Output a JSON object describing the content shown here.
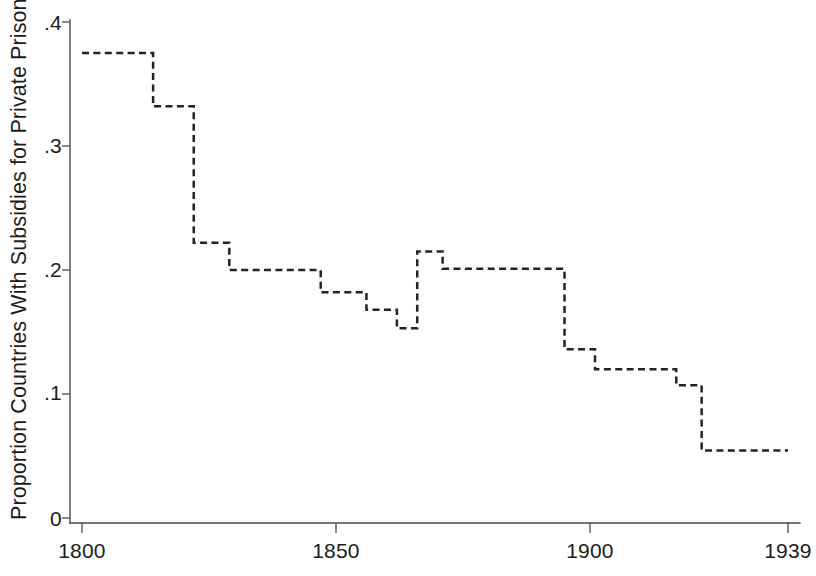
{
  "chart_data": {
    "type": "line",
    "line_style": "dashed step function",
    "title": "",
    "subtitle": "",
    "xlabel": "",
    "ylabel": "Proportion Countries With Subsidies for Private Prisons",
    "xlim": [
      1800,
      1939
    ],
    "ylim": [
      0,
      0.4
    ],
    "grid": false,
    "legend": null,
    "x_ticks": [
      1800,
      1850,
      1900,
      1939
    ],
    "x_tick_labels": [
      "1800",
      "1850",
      "1900",
      "1939"
    ],
    "y_ticks": [
      0,
      0.1,
      0.2,
      0.3,
      0.4
    ],
    "y_tick_labels": [
      "0",
      ".1",
      ".2",
      ".3",
      ".4"
    ],
    "annotations": [],
    "series": [
      {
        "name": "Proportion of countries with subsidies for private prisons",
        "step_segments": [
          {
            "x_start": 1800,
            "x_end": 1814,
            "value": 0.375
          },
          {
            "x_start": 1814,
            "x_end": 1822,
            "value": 0.332
          },
          {
            "x_start": 1822,
            "x_end": 1829,
            "value": 0.222
          },
          {
            "x_start": 1829,
            "x_end": 1847,
            "value": 0.2
          },
          {
            "x_start": 1847,
            "x_end": 1856,
            "value": 0.182
          },
          {
            "x_start": 1856,
            "x_end": 1862,
            "value": 0.168
          },
          {
            "x_start": 1862,
            "x_end": 1866,
            "value": 0.153
          },
          {
            "x_start": 1866,
            "x_end": 1871,
            "value": 0.215
          },
          {
            "x_start": 1871,
            "x_end": 1895,
            "value": 0.201
          },
          {
            "x_start": 1895,
            "x_end": 1901,
            "value": 0.136
          },
          {
            "x_start": 1901,
            "x_end": 1917,
            "value": 0.12
          },
          {
            "x_start": 1917,
            "x_end": 1922,
            "value": 0.107
          },
          {
            "x_start": 1922,
            "x_end": 1939,
            "value": 0.0545
          }
        ],
        "x": [
          1800,
          1814,
          1814,
          1822,
          1822,
          1829,
          1829,
          1847,
          1847,
          1856,
          1856,
          1862,
          1862,
          1866,
          1866,
          1871,
          1871,
          1895,
          1895,
          1901,
          1901,
          1917,
          1917,
          1922,
          1922,
          1939
        ],
        "y": [
          0.375,
          0.375,
          0.332,
          0.332,
          0.222,
          0.222,
          0.2,
          0.2,
          0.182,
          0.182,
          0.168,
          0.168,
          0.153,
          0.153,
          0.215,
          0.215,
          0.201,
          0.201,
          0.136,
          0.136,
          0.12,
          0.12,
          0.107,
          0.107,
          0.0545,
          0.0545
        ],
        "color": "#23232b"
      }
    ]
  },
  "axis": {
    "y_label": "Proportion Countries With Subsidies for Private Prisons",
    "y_tick_labels": [
      "0",
      ".1",
      ".2",
      ".3",
      ".4"
    ],
    "x_tick_labels": [
      "1800",
      "1850",
      "1900",
      "1939"
    ]
  },
  "colors": {
    "background": "#ffffff",
    "line": "#23232b",
    "axis": "#4a4a4a",
    "text": "#1c1c1c"
  }
}
